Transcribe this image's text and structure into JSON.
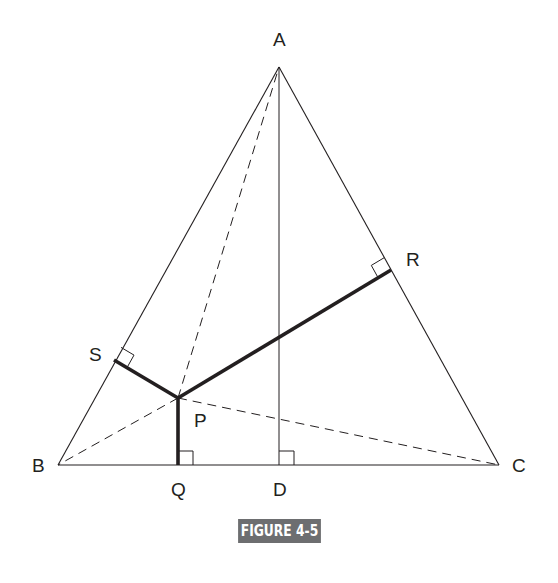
{
  "figure": {
    "caption": "FIGURE 4-5",
    "caption_bg": "#6d6e70",
    "line_color": "#231f20"
  },
  "points": {
    "A": {
      "label": "A",
      "x": 279,
      "y": 67
    },
    "B": {
      "label": "B",
      "x": 58,
      "y": 465
    },
    "C": {
      "label": "C",
      "x": 499,
      "y": 465
    },
    "D": {
      "label": "D",
      "x": 279,
      "y": 465
    },
    "P": {
      "label": "P",
      "x": 178,
      "y": 398
    },
    "Q": {
      "label": "Q",
      "x": 178,
      "y": 465
    },
    "R": {
      "label": "R",
      "x": 391,
      "y": 270
    },
    "S": {
      "label": "S",
      "x": 114,
      "y": 360
    }
  },
  "segments": {
    "triangle_sides": [
      "AB",
      "BC",
      "CA"
    ],
    "altitude": [
      "AD"
    ],
    "dashed": [
      "PA",
      "PB",
      "PC"
    ],
    "bold_perpendiculars": [
      "PQ",
      "PR",
      "PS"
    ]
  },
  "right_angle_marks": [
    "Q",
    "D",
    "R",
    "S"
  ]
}
